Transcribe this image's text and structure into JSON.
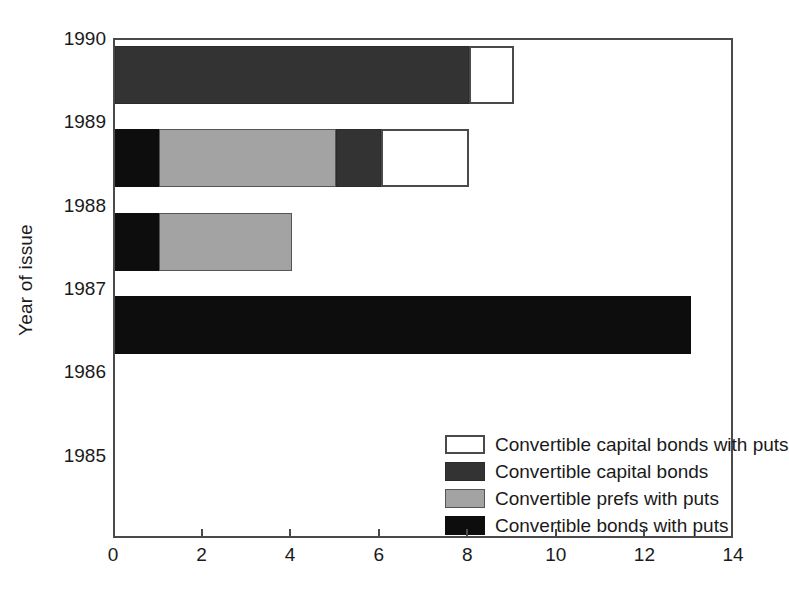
{
  "chart_data": {
    "type": "bar",
    "orientation": "horizontal",
    "stacked": true,
    "title": "",
    "xlabel": "",
    "ylabel": "Year of issue",
    "xlim": [
      0,
      14
    ],
    "ylim_categories": [
      "1985",
      "1986",
      "1987",
      "1988",
      "1989",
      "1990"
    ],
    "xticks": [
      "0",
      "2",
      "4",
      "6",
      "8",
      "10",
      "12",
      "14"
    ],
    "xtick_values": [
      0,
      2,
      4,
      6,
      8,
      10,
      12,
      14
    ],
    "grid": false,
    "legend_position": "inside-lower-center",
    "categories": [
      "1990",
      "1989",
      "1988",
      "1987",
      "1986",
      "1985"
    ],
    "series": [
      {
        "name": "Convertible capital bonds with puts",
        "color": "#ffffff",
        "values": [
          1,
          2,
          0,
          0,
          0,
          0
        ]
      },
      {
        "name": "Convertible capital bonds",
        "color": "#333333",
        "values": [
          8,
          1,
          0,
          0,
          0,
          0
        ]
      },
      {
        "name": "Convertible prefs with puts",
        "color": "#a3a3a3",
        "values": [
          0,
          4,
          3,
          0,
          0,
          0
        ]
      },
      {
        "name": "Convertible bonds with puts",
        "color": "#0d0d0d",
        "values": [
          0,
          1,
          1,
          13,
          0,
          0
        ]
      }
    ],
    "totals": [
      9,
      8,
      4,
      13,
      0,
      0
    ],
    "stacks": [
      {
        "year": "1990",
        "segments": [
          {
            "series": "Convertible capital bonds",
            "start": 0,
            "end": 8,
            "color": "#333333"
          },
          {
            "series": "Convertible capital bonds with puts",
            "start": 8,
            "end": 9,
            "color": "#ffffff"
          }
        ]
      },
      {
        "year": "1989",
        "segments": [
          {
            "series": "Convertible bonds with puts",
            "start": 0,
            "end": 1,
            "color": "#0d0d0d"
          },
          {
            "series": "Convertible prefs with puts",
            "start": 1,
            "end": 5,
            "color": "#a3a3a3"
          },
          {
            "series": "Convertible capital bonds",
            "start": 5,
            "end": 6,
            "color": "#333333"
          },
          {
            "series": "Convertible capital bonds with puts",
            "start": 6,
            "end": 8,
            "color": "#ffffff"
          }
        ]
      },
      {
        "year": "1988",
        "segments": [
          {
            "series": "Convertible bonds with puts",
            "start": 0,
            "end": 1,
            "color": "#0d0d0d"
          },
          {
            "series": "Convertible prefs with puts",
            "start": 1,
            "end": 4,
            "color": "#a3a3a3"
          }
        ]
      },
      {
        "year": "1987",
        "segments": [
          {
            "series": "Convertible bonds with puts",
            "start": 0,
            "end": 13,
            "color": "#0d0d0d"
          }
        ]
      },
      {
        "year": "1986",
        "segments": []
      },
      {
        "year": "1985",
        "segments": []
      }
    ]
  },
  "axes": {
    "y_title": "Year of issue",
    "y_ticks": [
      {
        "label": "1990"
      },
      {
        "label": "1989"
      },
      {
        "label": "1988"
      },
      {
        "label": "1987"
      },
      {
        "label": "1986"
      },
      {
        "label": "1985"
      }
    ],
    "x_ticks": [
      {
        "label": "0"
      },
      {
        "label": "2"
      },
      {
        "label": "4"
      },
      {
        "label": "6"
      },
      {
        "label": "8"
      },
      {
        "label": "10"
      },
      {
        "label": "12"
      },
      {
        "label": "14"
      }
    ]
  },
  "legend": {
    "items": [
      {
        "label": "Convertible capital bonds with puts",
        "swatch": "white"
      },
      {
        "label": "Convertible capital bonds",
        "swatch": "darkgrey"
      },
      {
        "label": "Convertible prefs with puts",
        "swatch": "grey"
      },
      {
        "label": "Convertible bonds with puts",
        "swatch": "black"
      }
    ]
  },
  "colors": {
    "white": "#ffffff",
    "darkgrey": "#333333",
    "grey": "#a3a3a3",
    "black": "#0d0d0d",
    "frame": "#4a4a4a",
    "text": "#1a1a1a"
  }
}
